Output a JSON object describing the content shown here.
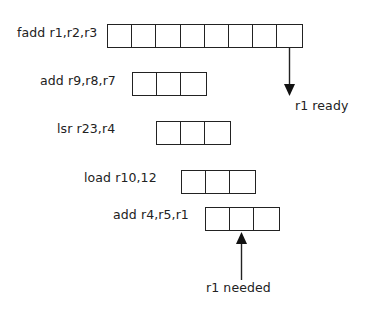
{
  "diagram": {
    "title": "",
    "instructions": [
      {
        "label": "fadd r1,r2,r3",
        "stages": 8,
        "x": 107,
        "y": 24,
        "label_x": 17,
        "label_y": 25
      },
      {
        "label": "add r9,r8,r7",
        "stages": 3,
        "x": 132,
        "y": 72,
        "label_x": 40,
        "label_y": 73
      },
      {
        "label": "lsr r23,r4",
        "stages": 3,
        "x": 156,
        "y": 121,
        "label_x": 57,
        "label_y": 121
      },
      {
        "label": "load r10,12",
        "stages": 3,
        "x": 181,
        "y": 170,
        "label_x": 84,
        "label_y": 170
      },
      {
        "label": "add r4,r5,r1",
        "stages": 3,
        "x": 205,
        "y": 207,
        "label_x": 113,
        "label_y": 207
      }
    ],
    "annotations": {
      "ready": "r1 ready",
      "needed": "r1 needed"
    },
    "colors": {
      "stroke": "#222222",
      "background": "#ffffff"
    }
  }
}
